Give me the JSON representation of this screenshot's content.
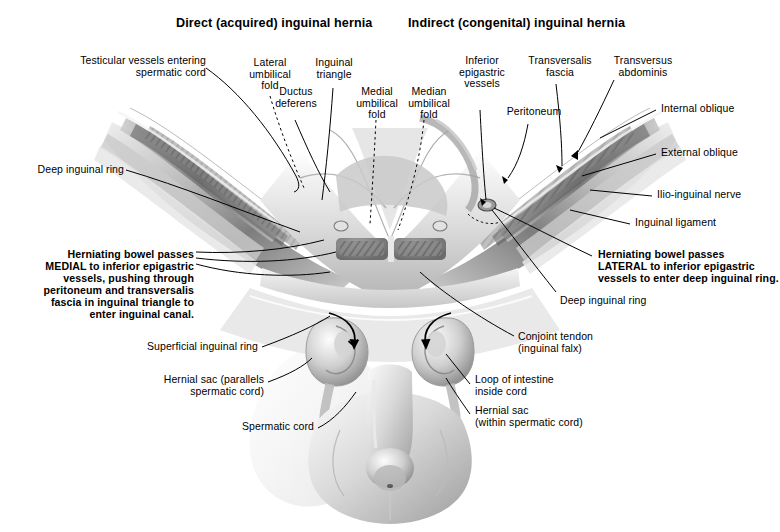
{
  "figure": {
    "type": "medical-illustration",
    "palette": {
      "ink": "#000000",
      "paper": "#ffffff",
      "tissue_dark": "#6d6d6d",
      "tissue_mid": "#a8a8a8",
      "tissue_light": "#d8d8d8"
    }
  },
  "titles": {
    "left": "Direct (acquired) inguinal hernia",
    "right": "Indirect (congenital) inguinal hernia"
  },
  "labels": {
    "testicular_vessels": "Testicular vessels entering\nspermatic cord",
    "lateral_umbilical_fold": "Lateral\numbilical\nfold",
    "inguinal_triangle": "Inguinal\ntriangle",
    "ductus_deferens": "Ductus\ndeferens",
    "medial_umbilical_fold": "Medial\numbilical\nfold",
    "median_umbilical_fold": "Median\numbilical\nfold",
    "inferior_epigastric_vessels": "Inferior\nepigastric\nvessels",
    "peritoneum": "Peritoneum",
    "transversalis_fascia": "Transversalis\nfascia",
    "transversus_abdominis": "Transversus\nabdominis",
    "internal_oblique": "Internal oblique",
    "external_oblique": "External oblique",
    "ilio_inguinal_nerve": "Ilio-inguinal nerve",
    "inguinal_ligament": "Inguinal ligament",
    "deep_inguinal_ring_left": "Deep inguinal ring",
    "deep_inguinal_ring_right": "Deep inguinal ring",
    "conjoint_tendon": "Conjoint tendon\n(inguinal falx)",
    "superficial_inguinal_ring": "Superficial inguinal ring",
    "hernial_sac_parallels": "Hernial sac (parallels\nspermatic cord)",
    "spermatic_cord": "Spermatic cord",
    "loop_of_intestine": "Loop of intestine\ninside cord",
    "hernial_sac_within": "Hernial sac\n(within spermatic cord)"
  },
  "annotations": {
    "direct_note": "Herniating bowel passes\nMEDIAL to inferior epigastric\nvessels, pushing through\nperitoneum and transversalis\nfascia in inguinal triangle to\nenter inguinal canal.",
    "indirect_note": "Herniating bowel passes\nLATERAL to inferior epigastric\nvessels to enter deep inguinal ring."
  }
}
